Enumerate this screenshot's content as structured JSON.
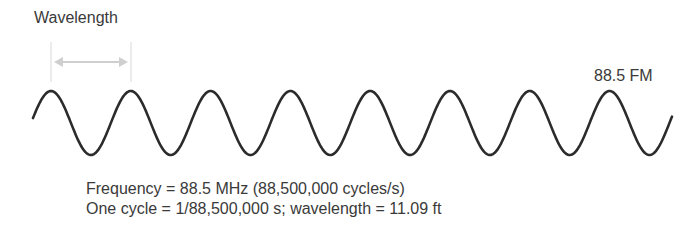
{
  "diagram": {
    "wavelength_label": "Wavelength",
    "station_label": "88.5 FM",
    "frequency_text": "Frequency = 88.5 MHz (88,500,000 cycles/s)",
    "cycle_text": "One cycle = 1/88,500,000 s; wavelength = 11.09 ft",
    "wave": {
      "cycles_shown": 8,
      "stroke_color": "#2b2b2b",
      "marker_color": "#cfcfcf"
    }
  }
}
